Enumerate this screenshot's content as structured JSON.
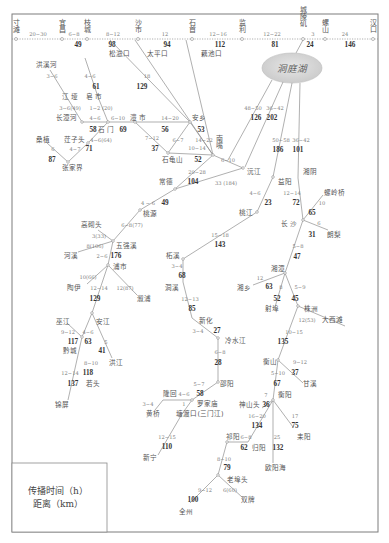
{
  "mainstem": {
    "stations": [
      "寸滩",
      "宜昌",
      "枝城",
      "沙市",
      "石首",
      "监利",
      "城陵矶",
      "螺山",
      "汉口"
    ],
    "times": [
      "20~30",
      "6~8",
      "8~12",
      "12",
      "12~16",
      "12~22",
      "3",
      "24"
    ],
    "distances": [
      "49",
      "98",
      "94",
      "112",
      "81",
      "24",
      "146"
    ],
    "outlets": [
      "松滋口",
      "太平口",
      "藕池口"
    ]
  },
  "lake": {
    "name": "洞庭湖"
  },
  "stations": {
    "hongxihe": "洪溪河",
    "jiangya": "江 垭",
    "zaoshi": "皂 市",
    "changtanhe": "长潭河",
    "lishi": "澧 市",
    "shimen": "石 门",
    "anxiang": "安乡",
    "sangzhi": "桑植",
    "jiangzitou": "茳子头",
    "zhangjiajie": "张家界",
    "nanzui": "南嘴",
    "shiguishan": "石龟山",
    "yuanjiang": "沅江",
    "changde": "常德",
    "yiyang": "益阳",
    "taojiang": "桃江",
    "xiangyin": "湘阴",
    "taoyuan": "桃源",
    "gaoqitou": "高砌头",
    "wuqiangxi": "五强溪",
    "hexi": "河溪",
    "pushi": "浦市",
    "taoyi": "陶伊",
    "xupu": "溆浦",
    "wujiang": "巫江",
    "anjiang": "安江",
    "qiancheng": "黔城",
    "hongjiang": "洪江",
    "ruotou": "若头",
    "jinping": "锦屏",
    "zhexi": "柘溪",
    "dongxi": "洞溪",
    "xinhua": "新化",
    "lengshuijiang": "冷水江",
    "shaoyang": "邵阳",
    "longhui": "隆回",
    "luojiamiao": "罗家庙",
    "huangqiao": "黄桥",
    "tangdukou": "塘渡口(三门江)",
    "xinning": "新宁",
    "luolingqiao": "螺岭桥",
    "changsha": "长 沙",
    "langli": "朗梨",
    "xiangtan": "湘潭",
    "xiangxiang": "湘乡",
    "shebu": "射埠",
    "zhuzhou": "株洲",
    "daxitan": "大西滩",
    "hengshan": "衡山",
    "ganxi": "甘溪",
    "hengyang": "衡阳",
    "shenshantou": "神山头",
    "qiyang": "祁阳",
    "guiyang": "归阳",
    "leiyang": "耒阳",
    "ouyanghai": "欧阳海",
    "laobutou": "老埠头",
    "quanzhou": "全州",
    "shuangpai": "双牌"
  },
  "segments": {
    "s1": {
      "time": "18",
      "dist": "129"
    },
    "s2": {
      "time": "48~50",
      "dist": "126"
    },
    "s3": {
      "time": "36~42",
      "dist": "202"
    },
    "s4": {
      "time": "50~58",
      "dist": "186"
    },
    "s5": {
      "time": "36~42",
      "dist": "101"
    },
    "s6": {
      "time": "3~6"
    },
    "s7": {
      "time": "4~6",
      "dist": "61"
    },
    "s8": {
      "time": "3~6(49)"
    },
    "s9": {
      "time": "1~2 (20)"
    },
    "s10": {
      "time": "4~6",
      "dist": "58"
    },
    "s11": {
      "time": "6~10",
      "dist": "69"
    },
    "s12": {
      "time": "14~20",
      "dist": "56"
    },
    "s13": {
      "time": "14~22",
      "dist": "53"
    },
    "s15": {
      "time": "4~6(64)"
    },
    "s16": {
      "time": "6",
      "dist": "87"
    },
    "s17": {
      "time": "4~7",
      "dist": "71"
    },
    "s18": {
      "time": "7~12",
      "dist": "37"
    },
    "s19": {
      "time": "6~7"
    },
    "s21": {
      "time": "10~14",
      "dist": "52"
    },
    "s22": {
      "time": "6~10"
    },
    "s23": {
      "time": "20~28",
      "dist": "104"
    },
    "s24": {
      "time": "33 (184)"
    },
    "s25": {
      "time": "4~6",
      "dist": "23"
    },
    "s26": {
      "time": "15~18",
      "dist": "143"
    },
    "s27": {
      "time": "4 ~ 6",
      "dist": "49"
    },
    "s28": {
      "time": "6~8(77)"
    },
    "s29": {
      "time": "3(33)"
    },
    "s30": {
      "time": "8(106)"
    },
    "s31": {
      "time": "2~6",
      "dist": "176"
    },
    "s32": {
      "time": "10(66)"
    },
    "s33": {
      "time": "12~14",
      "dist": "129"
    },
    "s34": {
      "time": "12(87)"
    },
    "s35": {
      "time": "9~12",
      "dist": "117"
    },
    "s36": {
      "time": "4~6",
      "dist": "63"
    },
    "s37": {
      "time": "5",
      "dist": "41"
    },
    "s38": {
      "time": "8~10",
      "dist": "118"
    },
    "s39": {
      "time": "12~14",
      "dist": "137"
    },
    "s40": {
      "time": "3~4",
      "dist": "68"
    },
    "s41": {
      "time": "12~13",
      "dist": "85"
    },
    "s42": {
      "time": "3~4",
      "dist": "27"
    },
    "s43": {
      "time": "6~8",
      "dist": "28"
    },
    "s44": {
      "time": "5~7"
    },
    "s45": {
      "time": "4~6",
      "dist": "58"
    },
    "s46": {
      "time": "3~4"
    },
    "s47": {
      "time": "1"
    },
    "s48": {
      "time": "12~15",
      "dist": "110"
    },
    "s49": {
      "time": "12~14",
      "dist": "72"
    },
    "s50": {
      "time": "10",
      "dist": "65"
    },
    "s51": {
      "time": "6",
      "dist": "31"
    },
    "s52": {
      "time": "5~8",
      "dist": "47"
    },
    "s53": {
      "time": "12",
      "dist": "63"
    },
    "s54": {
      "time": "8",
      "dist": "52"
    },
    "s55": {
      "time": "5~9",
      "dist": "45"
    },
    "s56": {
      "time": "12(53)"
    },
    "s57": {
      "time": "10~15",
      "dist": "135"
    },
    "s58": {
      "time": "9~12",
      "dist": "37"
    },
    "s59": {
      "time": "5~10",
      "dist": "67"
    },
    "s60": {
      "time": "7",
      "dist": "36"
    },
    "s61": {
      "time": "16~20",
      "dist": "134"
    },
    "s62": {
      "time": "17",
      "dist": "75"
    },
    "s63": {
      "time": "25",
      "dist": "132"
    },
    "s64": {
      "time": "6~8",
      "dist": "62"
    },
    "s65": {
      "time": "8~10",
      "dist": "79"
    },
    "s66": {
      "time": "9~12",
      "dist": "100"
    },
    "s67": {
      "time": "6(60)"
    }
  },
  "legend": {
    "line1": "传播时间（h）",
    "line2": "距离（km）"
  }
}
